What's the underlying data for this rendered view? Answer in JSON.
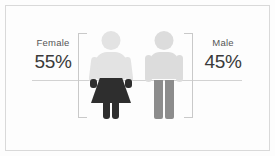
{
  "chart_data": {
    "type": "bar",
    "title": "",
    "subtitle": "",
    "xlabel": "",
    "ylabel": "",
    "categories": [
      "Female",
      "Male"
    ],
    "values": [
      55,
      45
    ],
    "value_labels": [
      "55%",
      "45%"
    ],
    "units": "percent",
    "grid": false,
    "legend_position": "none",
    "note": "Pictogram infographic: two human figures representing gender split"
  },
  "left": {
    "name": "Female",
    "percent": "55%"
  },
  "right": {
    "name": "Male",
    "percent": "45%"
  },
  "colors": {
    "background": "#fdfdfd",
    "frame": "#d9d9d9",
    "baseline": "#d2d2d2",
    "bracket": "#c9c9c9",
    "female_body": "#e3e3e3",
    "female_dark": "#2e2e2e",
    "male_body": "#dcdcdc",
    "male_legs": "#8c8c8c",
    "label_text": "#555555",
    "percent_text": "#3a3a3a"
  }
}
